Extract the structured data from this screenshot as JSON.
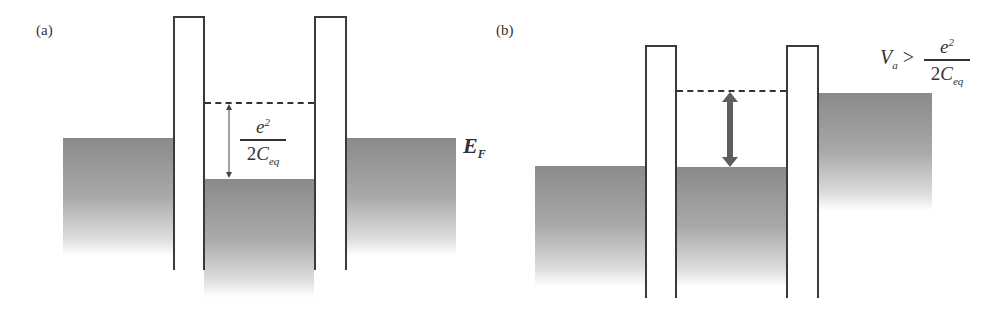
{
  "figure": {
    "panels": [
      {
        "id": "a",
        "label": "(a)",
        "energy_label": "E",
        "energy_label_sub": "F",
        "charging_energy": {
          "numerator": "e",
          "numerator_sup": "2",
          "denominator_coeff": "2",
          "denominator_var": "C",
          "denominator_sub": "eq"
        },
        "description": "Coulomb blockade: dot level lies e^2/2C_eq above Fermi level of both leads"
      },
      {
        "id": "b",
        "label": "(b)",
        "bias_condition": {
          "lhs": "V",
          "lhs_sub": "a",
          "relation": ">",
          "numerator": "e",
          "numerator_sup": "2",
          "denominator_coeff": "2",
          "denominator_var": "C",
          "denominator_sub": "eq"
        },
        "description": "Applied bias exceeds charging energy, lifting the right lead above the dot level"
      }
    ],
    "colors": {
      "fill_dark": "#8a8a8a",
      "barrier_line": "#3a3a3a",
      "arrow_thick": "#5e5e5e"
    }
  }
}
